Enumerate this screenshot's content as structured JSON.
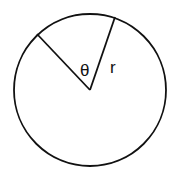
{
  "diagram": {
    "type": "circle-sector",
    "circle": {
      "cx": 90,
      "cy": 90,
      "r": 76
    },
    "center_point": {
      "x": 90,
      "y": 90
    },
    "radius_lines": [
      {
        "name": "radius-left",
        "x2": 37,
        "y2": 34
      },
      {
        "name": "radius-right",
        "x2": 115,
        "y2": 17
      }
    ],
    "labels": {
      "angle": "θ",
      "radius": "r"
    },
    "colors": {
      "stroke": "#111111",
      "background": "#ffffff"
    }
  }
}
